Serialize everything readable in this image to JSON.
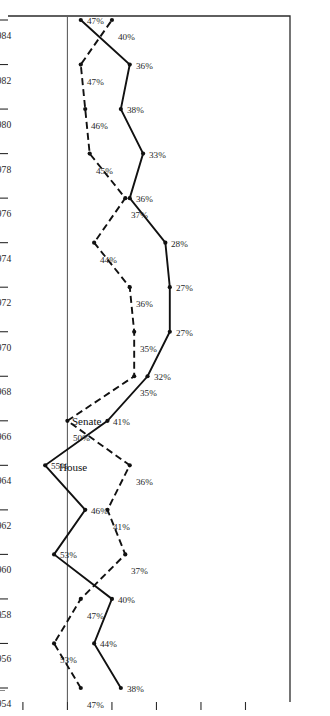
{
  "chart_data": {
    "type": "line",
    "title": "",
    "xlabel": "",
    "ylabel": "Percent of All Roll Calls",
    "orientation": "rotated-90-ccw",
    "categories": [
      1954,
      1956,
      1958,
      1960,
      1962,
      1964,
      1966,
      1968,
      1970,
      1972,
      1974,
      1976,
      1978,
      1980,
      1982,
      1984
    ],
    "x_tick_labels": [
      "1954",
      "1956",
      "1958",
      "1960",
      "1962",
      "1964",
      "1966",
      "1968",
      "1970",
      "1972",
      "1974",
      "1976",
      "1978",
      "1980",
      "1982",
      "1984"
    ],
    "y_tick_labels": [
      "60%",
      "50%",
      "40%",
      "30%",
      "20%",
      "10%"
    ],
    "y_ticks": [
      60,
      50,
      40,
      30,
      20,
      10
    ],
    "ylim": [
      0,
      62
    ],
    "reference_line": 50,
    "grid": false,
    "legend_position": "inline-annotation",
    "series": [
      {
        "name": "House",
        "style": "solid",
        "values": [
          38,
          44,
          40,
          53,
          46,
          55,
          41,
          32,
          27,
          27,
          28,
          36,
          33,
          38,
          36,
          47
        ],
        "point_labels": [
          "38%",
          "44%",
          "40%",
          "53%",
          "46%",
          "55%",
          "41%",
          "32%",
          "27%",
          "27%",
          "28%",
          "36%",
          "33%",
          "38%",
          "36%",
          "47%"
        ]
      },
      {
        "name": "Senate",
        "style": "dashed",
        "values": [
          47,
          53,
          47,
          37,
          41,
          36,
          50,
          35,
          35,
          36,
          44,
          37,
          45,
          46,
          47,
          40
        ],
        "point_labels": [
          "47%",
          "53%",
          "47%",
          "37%",
          "41%",
          "36%",
          "50%",
          "35%",
          "35%",
          "36%",
          "44%",
          "37%",
          "45%",
          "46%",
          "47%",
          "40%"
        ]
      }
    ]
  },
  "figure": {
    "axis_title": "Percent of All Roll Calls",
    "series_labels": {
      "house": "House",
      "senate": "Senate"
    }
  }
}
